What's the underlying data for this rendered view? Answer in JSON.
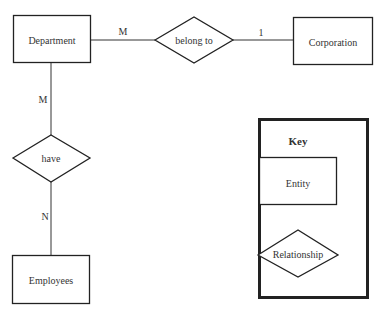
{
  "diagram": {
    "type": "entity-relationship",
    "entities": [
      {
        "id": "department",
        "label": "Department"
      },
      {
        "id": "corporation",
        "label": "Corporation"
      },
      {
        "id": "employees",
        "label": "Employees"
      }
    ],
    "relationships": [
      {
        "id": "belong_to",
        "label": "belong to",
        "from": "Department",
        "to": "Corporation",
        "from_card": "M",
        "to_card": "1"
      },
      {
        "id": "have",
        "label": "have",
        "from": "Department",
        "to": "Employees",
        "from_card": "M",
        "to_card": "N"
      }
    ],
    "cardinalities": {
      "dept_belong": "M",
      "belong_corp": "1",
      "dept_have": "M",
      "have_emp": "N"
    },
    "key": {
      "title": "Key",
      "entity_label": "Entity",
      "relationship_label": "Relationship"
    }
  }
}
